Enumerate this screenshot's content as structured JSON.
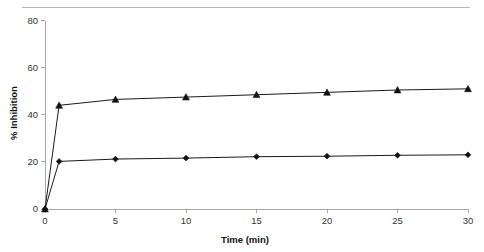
{
  "chart_data": {
    "type": "line",
    "title": "",
    "xlabel": "Time (min)",
    "ylabel": "% Inhibition",
    "xlim": [
      0,
      30
    ],
    "ylim": [
      0,
      80
    ],
    "x_ticks": [
      0,
      5,
      10,
      15,
      20,
      25,
      30
    ],
    "x_tick_labels": [
      "0",
      "5",
      "10",
      "15",
      "20",
      "25",
      "30"
    ],
    "y_ticks": [
      0,
      20,
      40,
      60,
      80
    ],
    "y_tick_labels": [
      "0",
      "20",
      "40",
      "60",
      "80"
    ],
    "grid": false,
    "legend": "none",
    "x": [
      0,
      1,
      5,
      10,
      15,
      20,
      25,
      30
    ],
    "series": [
      {
        "name": "upper-series",
        "marker": "triangle",
        "color": "#111111",
        "values": [
          0,
          44,
          46.5,
          47.5,
          48.5,
          49.5,
          50.5,
          51
        ]
      },
      {
        "name": "lower-series",
        "marker": "diamond",
        "color": "#111111",
        "values": [
          0,
          20.2,
          21.2,
          21.6,
          22.2,
          22.4,
          22.8,
          23
        ]
      }
    ]
  },
  "axis": {
    "x_title": "Time (min)",
    "y_title": "% Inhibition"
  }
}
